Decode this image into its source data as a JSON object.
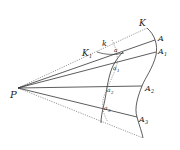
{
  "diagram": {
    "type": "geometric-projection",
    "stroke_color": "#333333",
    "labels": {
      "P": "P",
      "K": "K",
      "K1_main": "K",
      "K1_sub": "1",
      "k": "k",
      "A": "A",
      "A1_main": "A",
      "A1_sub": "1",
      "A2_main": "A",
      "A2_sub": "2",
      "A3_main": "A",
      "A3_sub": "3",
      "a": "a",
      "a1_main": "a",
      "a1_sub": "1",
      "a2_main": "a",
      "a2_sub": "2",
      "a3_main": "a",
      "a3_sub": "3"
    },
    "points": {
      "P": [
        18,
        88
      ],
      "K": [
        147,
        28
      ],
      "A": [
        155,
        40
      ],
      "A1": [
        156,
        52
      ],
      "A2": [
        142,
        86
      ],
      "A3": [
        137,
        117
      ],
      "curve_bottom": [
        143,
        138
      ]
    }
  }
}
